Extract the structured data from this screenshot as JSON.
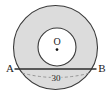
{
  "figure": {
    "kind": "geometry-diagram",
    "canvas": {
      "width": 112,
      "height": 102,
      "background": "#ffffff"
    },
    "colors": {
      "annulus_fill": "#dcdcdc",
      "inner_fill": "#ffffff",
      "stroke": "#3a3a3a",
      "chord_stroke": "#2e2e2e",
      "dashed_stroke": "#8c8c8c",
      "text": "#1a1a1a",
      "center_dot": "#111111"
    },
    "shapes": {
      "outer_circle": {
        "cx": 55.5,
        "cy": 47.5,
        "r": 42,
        "fill": "#dcdcdc",
        "stroke": "#3a3a3a"
      },
      "inner_circle": {
        "cx": 57,
        "cy": 47,
        "r": 19,
        "fill": "#ffffff",
        "stroke": "#3a3a3a"
      },
      "chord": {
        "x1": 14,
        "y1": 69,
        "x2": 97,
        "y2": 69
      },
      "dimension_arc": {
        "x1": 22,
        "y1": 74,
        "x2": 90,
        "y2": 74,
        "sag": 5,
        "style": "dashed"
      },
      "center_dot": {
        "cx": 57,
        "cy": 49.5,
        "r": 1.3
      }
    },
    "labels": {
      "point_a": "A",
      "point_b": "B",
      "center": "O",
      "dimension": "30"
    }
  }
}
